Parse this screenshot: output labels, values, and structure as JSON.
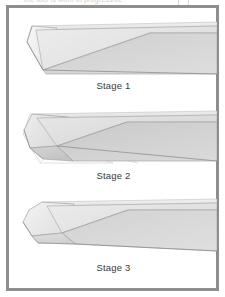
{
  "figure": {
    "caption_top": "the tool is worn in progressive",
    "frame_color": "#8e8e8e",
    "background_color": "#ffffff",
    "render_style": "isometric-3d-wedge-grayscale"
  },
  "panels": [
    {
      "id": "stage-1",
      "label": "Stage 1",
      "description": "Sharp wedge blade with flat beveled left end, single straight diagonal facet split",
      "facets": {
        "top_face": "#e9e9e9",
        "upper_left_facet": "#e4e4e4",
        "lower_right_facet": "#d2d2d2",
        "end_bevel": "#f2f2f2",
        "edge_stroke": "#9a9a9a"
      }
    },
    {
      "id": "stage-2",
      "label": "Stage 2",
      "description": "Partially worn tip with multiple intersecting chamfer facets and visible wireframe construction lines beneath",
      "facets": {
        "top_face": "#e1e1e1",
        "upper_left_facet": "#dcdcdc",
        "lower_right_facet": "#cfcfcf",
        "end_bevel": "#eeeeee",
        "edge_stroke": "#9a9a9a",
        "wireframe_stroke": "#c4c4c4"
      }
    },
    {
      "id": "stage-3",
      "label": "Stage 3",
      "description": "Fully rounded and chamfered blunt tip with smooth blended multi-facet nose",
      "facets": {
        "top_face": "#e9e9e9",
        "upper_left_facet": "#e3e3e3",
        "lower_right_facet": "#d6d6d6",
        "end_bevel": "#f0f0f0",
        "edge_stroke": "#9a9a9a"
      }
    }
  ]
}
